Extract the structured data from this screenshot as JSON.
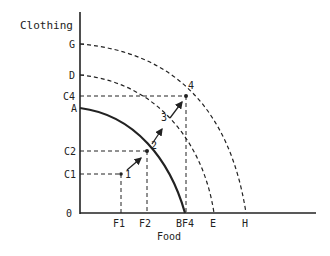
{
  "axes": {
    "y_label": "Clothing",
    "x_label": "Food",
    "origin_label": "0"
  },
  "y_ticks": {
    "G": "G",
    "D": "D",
    "C4": "C4",
    "A": "A",
    "C2": "C2",
    "C1": "C1"
  },
  "x_ticks": {
    "F1": "F1",
    "F2": "F2",
    "BF4": "BF4",
    "E": "E",
    "H": "H"
  },
  "points": {
    "p1": "1",
    "p2": "2",
    "p3": "3",
    "p4": "4"
  },
  "curves": [
    {
      "name": "AB",
      "style": "solid"
    },
    {
      "name": "DE",
      "style": "dashed"
    },
    {
      "name": "GH",
      "style": "dashed"
    }
  ],
  "colors": {
    "ink": "#222222",
    "background": "#ffffff"
  }
}
